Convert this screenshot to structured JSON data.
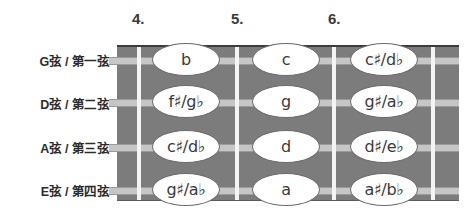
{
  "positions": [
    {
      "label": "4.",
      "x": 132
    },
    {
      "label": "5.",
      "x": 231
    },
    {
      "label": "6.",
      "x": 328
    }
  ],
  "strings": [
    {
      "label": "G弦 / 第一弦",
      "notes": [
        "b",
        "c",
        "c♯/d♭"
      ]
    },
    {
      "label": "D弦 / 第二弦",
      "notes": [
        "f♯/g♭",
        "g",
        "g♯/a♭"
      ]
    },
    {
      "label": "A弦 / 第三弦",
      "notes": [
        "c♯/d♭",
        "d",
        "d♯/e♭"
      ]
    },
    {
      "label": "E弦 / 第四弦",
      "notes": [
        "g♯/a♭",
        "a",
        "a♯/b♭"
      ]
    }
  ],
  "colors": {
    "fretboard": "#7c7c7c",
    "fret_line": "#f4f4f4",
    "string": "#c6c6c6",
    "note_fill": "#ffffff"
  }
}
